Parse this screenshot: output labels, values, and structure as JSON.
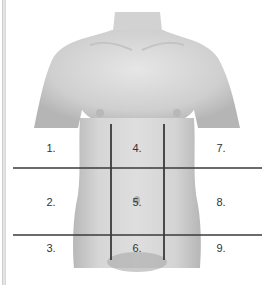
{
  "diagram": {
    "grid": {
      "horizontal_lines_y": [
        168,
        235
      ],
      "vertical_lines_x": [
        111,
        164
      ],
      "line_color": "#3a3a3a"
    },
    "regions": [
      {
        "label": "1.",
        "x": 51,
        "y": 148
      },
      {
        "label": "2.",
        "x": 51,
        "y": 202
      },
      {
        "label": "3.",
        "x": 51,
        "y": 248
      },
      {
        "label": "4.",
        "x": 137,
        "y": 148
      },
      {
        "label": "5.",
        "x": 137,
        "y": 202
      },
      {
        "label": "6.",
        "x": 137,
        "y": 248
      },
      {
        "label": "7.",
        "x": 221,
        "y": 148
      },
      {
        "label": "8.",
        "x": 221,
        "y": 202
      },
      {
        "label": "9.",
        "x": 221,
        "y": 248
      }
    ]
  }
}
